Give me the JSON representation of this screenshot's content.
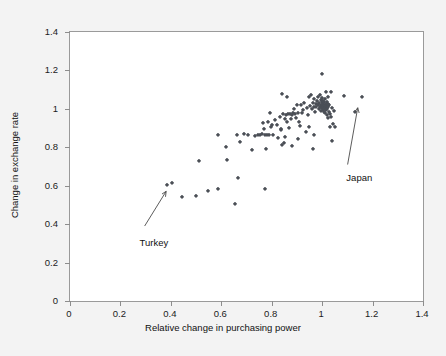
{
  "chart_data": {
    "type": "scatter",
    "title": "",
    "xlabel": "Relative change in purchasing power",
    "ylabel": "Change in exchange rate",
    "xlim": [
      0,
      1.4
    ],
    "ylim": [
      0,
      1.4
    ],
    "xticks": [
      "0",
      "0.2",
      "0.4",
      "0.6",
      "0.8",
      "1",
      "1.2",
      "1.4"
    ],
    "xtick_values": [
      0,
      0.2,
      0.4,
      0.6,
      0.8,
      1.0,
      1.2,
      1.4
    ],
    "yticks": [
      "0",
      "0.2",
      "0.4",
      "0.6",
      "0.8",
      "1",
      "1.2",
      "1.4"
    ],
    "ytick_values": [
      0,
      0.2,
      0.4,
      0.6,
      0.8,
      1.0,
      1.2,
      1.4
    ],
    "grid": false,
    "legend": null,
    "marker_color": "#4b4f56",
    "plot_background": "#ffffff",
    "figure_background": "#f3f3f3",
    "frame_color": "#9a9a9a",
    "annotations": [
      {
        "label": "Turkey",
        "label_x": 0.28,
        "label_y": 0.33,
        "arrow_from_x": 0.3,
        "arrow_from_y": 0.385,
        "arrow_to_x": 0.385,
        "arrow_to_y": 0.565
      },
      {
        "label": "Japan",
        "label_x": 1.1,
        "label_y": 0.665,
        "arrow_from_x": 1.105,
        "arrow_from_y": 0.705,
        "arrow_to_x": 1.145,
        "arrow_to_y": 1.0
      }
    ],
    "points": [
      [
        0.385,
        0.605
      ],
      [
        0.405,
        0.615
      ],
      [
        0.443,
        0.54
      ],
      [
        0.498,
        0.548
      ],
      [
        0.513,
        0.728
      ],
      [
        0.547,
        0.573
      ],
      [
        0.586,
        0.583
      ],
      [
        0.585,
        0.866
      ],
      [
        0.617,
        0.8
      ],
      [
        0.622,
        0.735
      ],
      [
        0.655,
        0.503
      ],
      [
        0.661,
        0.862
      ],
      [
        0.666,
        0.642
      ],
      [
        0.676,
        0.828
      ],
      [
        0.69,
        0.871
      ],
      [
        0.704,
        0.866
      ],
      [
        0.723,
        0.787
      ],
      [
        0.733,
        0.861
      ],
      [
        0.745,
        0.863
      ],
      [
        0.752,
        0.866
      ],
      [
        0.76,
        0.869
      ],
      [
        0.767,
        0.927
      ],
      [
        0.77,
        0.897
      ],
      [
        0.773,
        0.864
      ],
      [
        0.775,
        0.583
      ],
      [
        0.778,
        0.79
      ],
      [
        0.781,
        0.866
      ],
      [
        0.786,
        0.933
      ],
      [
        0.789,
        0.862
      ],
      [
        0.793,
        0.976
      ],
      [
        0.798,
        0.906
      ],
      [
        0.803,
        0.918
      ],
      [
        0.807,
        0.865
      ],
      [
        0.815,
        0.944
      ],
      [
        0.82,
        0.918
      ],
      [
        0.826,
        0.846
      ],
      [
        0.831,
        0.96
      ],
      [
        0.836,
        0.89
      ],
      [
        0.84,
        0.812
      ],
      [
        0.842,
        1.078
      ],
      [
        0.845,
        0.973
      ],
      [
        0.848,
        0.82
      ],
      [
        0.852,
        0.945
      ],
      [
        0.856,
        0.968
      ],
      [
        0.86,
        0.934
      ],
      [
        0.862,
        1.063
      ],
      [
        0.866,
        0.974
      ],
      [
        0.87,
        0.898
      ],
      [
        0.874,
        0.972
      ],
      [
        0.878,
        0.946
      ],
      [
        0.882,
        0.967
      ],
      [
        0.886,
        0.981
      ],
      [
        0.89,
        0.999
      ],
      [
        0.894,
        0.972
      ],
      [
        0.898,
        0.955
      ],
      [
        0.902,
        1.018
      ],
      [
        0.906,
        0.976
      ],
      [
        0.91,
        0.93
      ],
      [
        0.914,
        0.913
      ],
      [
        0.918,
        1.019
      ],
      [
        0.922,
        0.976
      ],
      [
        0.926,
        0.994
      ],
      [
        0.93,
        1.029
      ],
      [
        0.934,
        0.882
      ],
      [
        0.938,
        1.003
      ],
      [
        0.942,
        0.966
      ],
      [
        0.946,
        1.064
      ],
      [
        0.95,
        1.016
      ],
      [
        0.954,
        1.074
      ],
      [
        0.958,
        0.997
      ],
      [
        0.962,
        1.033
      ],
      [
        0.966,
        1.009
      ],
      [
        0.968,
        1.053
      ],
      [
        0.971,
        0.985
      ],
      [
        0.974,
        1.026
      ],
      [
        0.977,
        1.008
      ],
      [
        0.98,
        1.043
      ],
      [
        0.982,
        1.062
      ],
      [
        0.984,
        1.018
      ],
      [
        0.986,
        0.999
      ],
      [
        0.988,
        1.031
      ],
      [
        0.99,
        1.073
      ],
      [
        0.992,
        1.011
      ],
      [
        0.994,
        1.046
      ],
      [
        0.995,
        0.991
      ],
      [
        0.996,
        1.022
      ],
      [
        0.997,
        1.008
      ],
      [
        0.998,
        1.037
      ],
      [
        0.999,
        1.003
      ],
      [
        1.0,
        1.019
      ],
      [
        1.0,
        1.18
      ],
      [
        1.001,
        1.055
      ],
      [
        1.002,
        0.994
      ],
      [
        1.003,
        1.03
      ],
      [
        1.004,
        1.012
      ],
      [
        1.005,
        1.043
      ],
      [
        1.006,
        0.986
      ],
      [
        1.007,
        1.021
      ],
      [
        1.008,
        1.001
      ],
      [
        1.009,
        1.034
      ],
      [
        1.01,
        1.014
      ],
      [
        1.011,
        0.978
      ],
      [
        1.012,
        1.049
      ],
      [
        1.013,
        1.005
      ],
      [
        1.014,
        1.027
      ],
      [
        1.015,
        0.993
      ],
      [
        1.016,
        1.016
      ],
      [
        1.017,
        1.088
      ],
      [
        1.018,
        0.97
      ],
      [
        1.019,
        1.008
      ],
      [
        1.02,
        1.036
      ],
      [
        1.021,
        0.999
      ],
      [
        1.022,
        1.024
      ],
      [
        1.023,
        0.951
      ],
      [
        1.024,
        1.011
      ],
      [
        1.025,
        1.06
      ],
      [
        1.026,
        0.984
      ],
      [
        1.028,
        1.02
      ],
      [
        1.03,
        0.904
      ],
      [
        1.032,
        0.975
      ],
      [
        1.034,
        1.088
      ],
      [
        1.036,
        0.96
      ],
      [
        1.038,
        1.002
      ],
      [
        1.04,
        0.834
      ],
      [
        1.042,
        0.92
      ],
      [
        1.046,
        0.988
      ],
      [
        1.05,
        0.908
      ],
      [
        0.962,
        0.79
      ],
      [
        0.968,
        0.862
      ],
      [
        1.086,
        1.066
      ],
      [
        1.13,
        0.986
      ],
      [
        1.158,
        1.062
      ],
      [
        0.905,
        0.843
      ],
      [
        0.88,
        0.806
      ],
      [
        0.852,
        0.855
      ],
      [
        0.835,
        0.893
      ],
      [
        0.948,
        0.903
      ]
    ]
  },
  "meta": {
    "x_axis_title": "Relative change in purchasing power",
    "y_axis_title": "Change in exchange rate"
  }
}
